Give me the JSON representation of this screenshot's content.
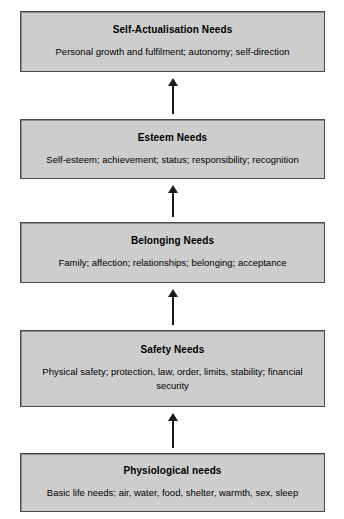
{
  "diagram": {
    "name": "maslow-hierarchy-of-needs",
    "orientation": "vertical-ascending",
    "colors": {
      "box_fill": "#cdcdcd",
      "box_border": "#4a4a4a",
      "text": "#000000",
      "arrow": "#1a1a1a",
      "background": "#ffffff"
    },
    "levels": [
      {
        "title": "Self-Actualisation Needs",
        "description": "Personal growth and fulfilment; autonomy; self-direction"
      },
      {
        "title": "Esteem Needs",
        "description": "Self-esteem; achievement; status; responsibility; recognition"
      },
      {
        "title": "Belonging Needs",
        "description": "Family; affection; relationships; belonging; acceptance"
      },
      {
        "title": "Safety Needs",
        "description": "Physical safety; protection, law, order, limits, stability; financial security"
      },
      {
        "title": "Physiological needs",
        "description": "Basic life needs; air, water, food, shelter, warmth, sex, sleep"
      }
    ],
    "connectors": [
      {
        "name": "arrow-up-physiological-to-safety",
        "icon": "arrow-up-icon"
      },
      {
        "name": "arrow-up-safety-to-belonging",
        "icon": "arrow-up-icon"
      },
      {
        "name": "arrow-up-belonging-to-esteem",
        "icon": "arrow-up-icon"
      },
      {
        "name": "arrow-up-esteem-to-self-actualisation",
        "icon": "arrow-up-icon"
      }
    ]
  }
}
